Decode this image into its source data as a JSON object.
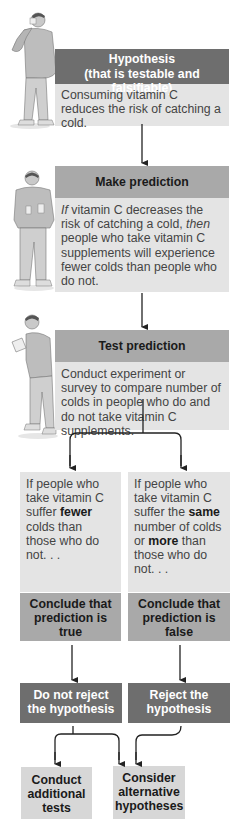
{
  "steps": [
    {
      "title_line1": "Hypothesis",
      "title_line2": "(that is testable and falsifiable)",
      "body": "Consuming vitamin C reduces the risk of catching a cold."
    },
    {
      "title": "Make prediction",
      "body_pre_italic": "If",
      "body_mid": " vitamin C decreases the risk of catching a cold, ",
      "body_italic2": "then",
      "body_post": " people who take vitamin C supplements will experience fewer colds than people who do not."
    },
    {
      "title": "Test prediction",
      "body": "Conduct experiment or survey to compare number of colds in people who do and do not take vitamin C supplements."
    }
  ],
  "branches": {
    "left": {
      "condition_pre": "If people who take vitamin C suffer ",
      "condition_bold": "fewer",
      "condition_post": " colds than those who do not. . .",
      "conclusion": "Conclude that prediction is true",
      "decision": "Do not reject the hypothesis"
    },
    "right": {
      "condition_pre": "If people who take vitamin C suffer the ",
      "condition_bold1": "same",
      "condition_mid": " number of colds or ",
      "condition_bold2": "more",
      "condition_post": " than those who do not. . .",
      "conclusion": "Conclude that prediction is false",
      "decision": "Reject the hypothesis"
    }
  },
  "outcomes": {
    "left": "Conduct additional tests",
    "right": "Consider alternative hypotheses"
  },
  "colors": {
    "dark_header": "#6e6e6e",
    "mid_header": "#a9a9a9",
    "light_body": "#e4e4e4",
    "arrow": "#222222"
  }
}
